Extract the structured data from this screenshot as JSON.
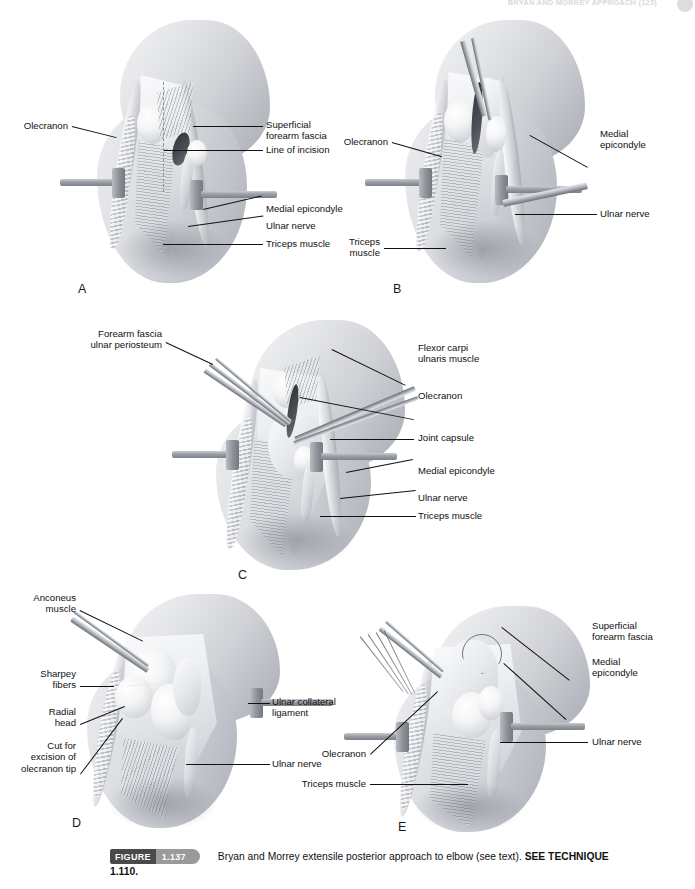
{
  "page": {
    "running_head": "BRYAN AND MORREY APPROACH (123)",
    "width": 695,
    "height": 889
  },
  "caption": {
    "figure_word": "FIGURE",
    "figure_number": "1.137",
    "text_before_bold": "Bryan and Morrey extensile posterior approach to elbow (see text). ",
    "bold_text": "SEE TECHNIQUE",
    "second_line": "1.110."
  },
  "panels": [
    {
      "letter": "A",
      "labels_left": [
        {
          "text": "Olecranon"
        }
      ],
      "labels_right": [
        {
          "text": "Superficial\nforearm fascia"
        },
        {
          "text": "Line of incision"
        },
        {
          "text": "Medial epicondyle"
        },
        {
          "text": "Ulnar nerve"
        },
        {
          "text": "Triceps muscle"
        }
      ]
    },
    {
      "letter": "B",
      "labels_left": [
        {
          "text": "Olecranon"
        },
        {
          "text": "Triceps\nmuscle"
        }
      ],
      "labels_right": [
        {
          "text": "Medial\nepicondyle"
        },
        {
          "text": "Ulnar nerve"
        }
      ]
    },
    {
      "letter": "C",
      "labels_left": [
        {
          "text": "Forearm fascia\nulnar periosteum"
        }
      ],
      "labels_right": [
        {
          "text": "Flexor carpi\nulnaris muscle"
        },
        {
          "text": "Olecranon"
        },
        {
          "text": "Joint capsule"
        },
        {
          "text": "Medial epicondyle"
        },
        {
          "text": "Ulnar nerve"
        },
        {
          "text": "Triceps muscle"
        }
      ]
    },
    {
      "letter": "D",
      "labels_left": [
        {
          "text": "Anconeus\nmuscle"
        },
        {
          "text": "Sharpey\nfibers"
        },
        {
          "text": "Radial\nhead"
        },
        {
          "text": "Cut for\nexcision of\nolecranon tip"
        }
      ],
      "labels_right": [
        {
          "text": "Ulnar collateral\nligament"
        },
        {
          "text": "Ulnar nerve"
        }
      ]
    },
    {
      "letter": "E",
      "labels_left": [
        {
          "text": "Olecranon"
        },
        {
          "text": "Triceps muscle"
        }
      ],
      "labels_right": [
        {
          "text": "Superficial\nforearm fascia"
        },
        {
          "text": "Medial\nepicondyle"
        },
        {
          "text": "Ulnar nerve"
        }
      ]
    }
  ],
  "colors": {
    "ink": "#111111",
    "badge_dark": "#4a4a4a",
    "badge_light": "#9a9a9a",
    "page_bg": "#ffffff"
  }
}
